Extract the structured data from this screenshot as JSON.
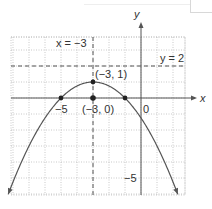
{
  "chart_data": {
    "type": "line",
    "title": "",
    "xlabel": "x",
    "ylabel": "y",
    "xlim": [
      -8,
      3
    ],
    "ylim": [
      -6,
      4
    ],
    "grid": true,
    "function": "y = 1 - (x + 3)^2 / 4",
    "series": [
      {
        "name": "parabola",
        "x": [
          -8.3,
          -8,
          -7,
          -6,
          -5,
          -4,
          -3,
          -2,
          -1,
          0,
          1,
          2,
          2.3
        ],
        "y": [
          -6.02,
          -5.25,
          -3,
          -1.25,
          0,
          0.75,
          1,
          0.75,
          0,
          -1.25,
          -3,
          -5.25,
          -6.02
        ]
      }
    ],
    "points": [
      {
        "name": "vertex",
        "x": -3,
        "y": 1,
        "label": "(−3, 1)"
      },
      {
        "name": "focus-center",
        "x": -3,
        "y": 0,
        "label": "(−3, 0)"
      },
      {
        "name": "root-left",
        "x": -5,
        "y": 0,
        "label": ""
      },
      {
        "name": "root-right",
        "x": -1,
        "y": 0,
        "label": ""
      }
    ],
    "reference_lines": [
      {
        "orientation": "vertical",
        "value": -3,
        "label": "x = −3",
        "style": "dashed"
      },
      {
        "orientation": "horizontal",
        "value": 2,
        "label": "y = 2",
        "style": "dashed"
      }
    ],
    "tick_labels": [
      {
        "axis": "x",
        "value": -5,
        "label": "−5"
      },
      {
        "axis": "x",
        "value": 0,
        "label": "0"
      },
      {
        "axis": "y",
        "value": -5,
        "label": "−5"
      }
    ],
    "colors": {
      "curve": "#555555",
      "axis": "#555555",
      "grid": "#bbbbbb",
      "dashed": "#555555",
      "point": "#222222"
    }
  }
}
